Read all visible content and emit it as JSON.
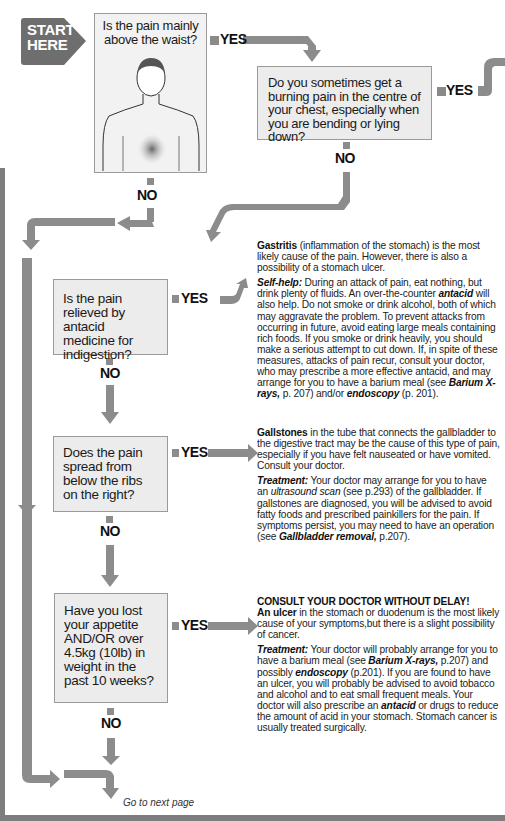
{
  "start": {
    "line1": "START",
    "line2": "HERE"
  },
  "questions": [
    {
      "id": "q1",
      "text": "Is the pain mainly above the waist?",
      "image": "torso-illustration-with-shaded-abdomen",
      "yes": "YES",
      "no": "NO"
    },
    {
      "id": "q2",
      "text": "Do you sometimes get a burning pain in the centre of your chest, especially when you are bending or lying down?",
      "yes": "YES",
      "no": "NO"
    },
    {
      "id": "q3",
      "text": "Is the pain relieved by antacid medicine for indigestion?",
      "yes": "YES",
      "no": "NO"
    },
    {
      "id": "q4",
      "text": "Does the pain spread from below the ribs on the right?",
      "yes": "YES",
      "no": "NO"
    },
    {
      "id": "q5",
      "text": "Have you lost your appetite AND/OR over 4.5kg (10lb) in weight in the past 10 weeks?",
      "yes": "YES",
      "no": "NO"
    }
  ],
  "answers": {
    "gastritis": {
      "term": "Gastritis",
      "intro": " (inflammation of the stomach) is the most likely cause of the pain. However, there is also a possibility of a stomach ulcer.",
      "selfhelp_label": "Self-help:",
      "selfhelp_a": " During an attack of pain, eat nothing, but drink plenty of fluids. An over-the-counter ",
      "selfhelp_antacid": "antacid",
      "selfhelp_b": " will also help. Do not smoke or drink alcohol, both of which may aggravate the problem. To prevent attacks from occurring in future, avoid eating large meals containing rich foods. If you smoke or drink heavily, you should make a serious attempt to cut down. If, in spite of these measures, attacks of pain recur, consult your doctor, who may prescribe a more effective antacid, and may arrange for you to have a barium meal (see ",
      "ref1": "Barium X-rays,",
      "ref1_page": " p. 207) and/or ",
      "ref2": "endoscopy",
      "ref2_page": " (p. 201)."
    },
    "gallstones": {
      "term": "Gallstones",
      "intro": " in the tube that connects the gallbladder to the digestive tract may be the cause of this type of pain, especially if you have felt nauseated or have vomited. Consult your doctor.",
      "treatment_label": "Treatment:",
      "t_a": " Your doctor may arrange for you to have an ",
      "t_scan": "ultrasound scan",
      "t_b": " (see p.293) of the gallbladder. If gallstones are diagnosed, you will be advised to avoid fatty foods and prescribed painkillers for the pain. If symptoms persist, you may need to have an operation (see ",
      "t_ref": "Gallbladder removal,",
      "t_c": " p.207)."
    },
    "ulcer": {
      "warning": "CONSULT YOUR DOCTOR WITHOUT DELAY!",
      "term": "An ulcer",
      "intro": " in the stomach or duodenum is the most likely cause of your symptoms,but there is a slight possibility of cancer.",
      "treatment_label": "Treatment:",
      "t_a": " Your doctor will probably arrange for you to have a barium meal (see ",
      "t_ref1": "Barium X-rays,",
      "t_b": " p.207) and possibly ",
      "t_ref2": "endoscopy",
      "t_c": " (p.201). If you are found to have an ulcer, you will probably be advised to avoid tobacco and alcohol and to eat small frequent meals. Your doctor will also prescribe an ",
      "t_antacid": "antacid",
      "t_d": " or drugs to reduce the amount of acid in your stomach. Stomach cancer is usually treated surgically."
    }
  },
  "footer": {
    "next": "Go to next page"
  },
  "colors": {
    "arrow": "#8c8c8c",
    "box": "#ececec",
    "frame": "#7d7d7d",
    "start": "#6e6e6e"
  }
}
